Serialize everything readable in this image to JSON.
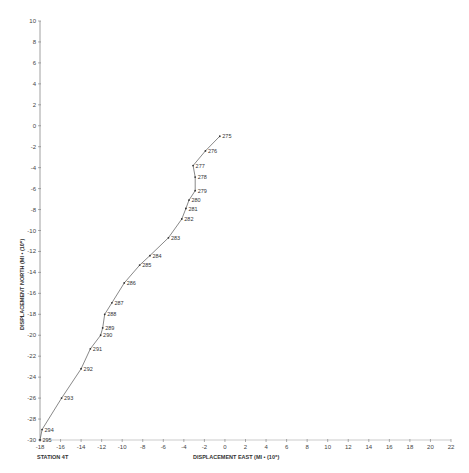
{
  "chart_data": {
    "type": "line",
    "title": "",
    "xlabel": "DISPLACEMENT EAST (MI • (10⁶)",
    "ylabel": "DISPLACEMENT NORTH (MI • (10⁶)",
    "station_label": "STATION 4T",
    "xlim": [
      -18,
      22
    ],
    "ylim": [
      -30,
      10
    ],
    "x_ticks": [
      -18,
      -16,
      -14,
      -12,
      -10,
      -8,
      -6,
      -4,
      -2,
      0,
      2,
      4,
      6,
      8,
      10,
      12,
      14,
      16,
      18,
      20,
      22
    ],
    "y_ticks": [
      10,
      8,
      6,
      4,
      2,
      0,
      -2,
      -4,
      -6,
      -8,
      -10,
      -12,
      -14,
      -16,
      -18,
      -20,
      -22,
      -24,
      -26,
      -28,
      -30
    ],
    "grid": false,
    "legend": null,
    "series": [
      {
        "name": "Station 4T track",
        "points": [
          {
            "label": "275",
            "x": -0.5,
            "y": -1.0
          },
          {
            "label": "276",
            "x": -1.9,
            "y": -2.4
          },
          {
            "label": "277",
            "x": -3.1,
            "y": -3.8
          },
          {
            "label": "278",
            "x": -2.9,
            "y": -4.9
          },
          {
            "label": "279",
            "x": -2.9,
            "y": -6.2
          },
          {
            "label": "280",
            "x": -3.5,
            "y": -7.1
          },
          {
            "label": "281",
            "x": -3.8,
            "y": -7.9
          },
          {
            "label": "282",
            "x": -4.2,
            "y": -8.9
          },
          {
            "label": "283",
            "x": -5.5,
            "y": -10.7
          },
          {
            "label": "284",
            "x": -7.3,
            "y": -12.4
          },
          {
            "label": "285",
            "x": -8.3,
            "y": -13.3
          },
          {
            "label": "286",
            "x": -9.8,
            "y": -15.0
          },
          {
            "label": "287",
            "x": -11.0,
            "y": -16.9
          },
          {
            "label": "288",
            "x": -11.7,
            "y": -18.0
          },
          {
            "label": "289",
            "x": -11.9,
            "y": -19.3
          },
          {
            "label": "290",
            "x": -12.1,
            "y": -20.0
          },
          {
            "label": "291",
            "x": -13.1,
            "y": -21.3
          },
          {
            "label": "292",
            "x": -14.0,
            "y": -23.2
          },
          {
            "label": "293",
            "x": -15.9,
            "y": -26.0
          },
          {
            "label": "294",
            "x": -17.8,
            "y": -29.0
          },
          {
            "label": "295",
            "x": -18.0,
            "y": -30.0
          }
        ]
      }
    ]
  }
}
